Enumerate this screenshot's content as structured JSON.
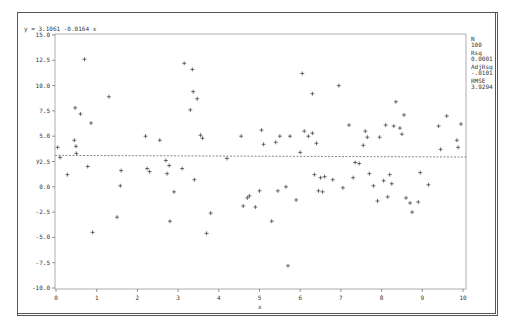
{
  "equation": "y = 3.1061 -0.0164 x",
  "stats": [
    {
      "label": "N",
      "value": "100"
    },
    {
      "label": "Rsq",
      "value": "0.0001"
    },
    {
      "label": "AdjRsq",
      "value": "-.0101"
    },
    {
      "label": "RMSE",
      "value": "3.9294"
    }
  ],
  "chart_data": {
    "type": "scatter",
    "title": "y = 3.1061 -0.0164 x",
    "xlabel": "x",
    "ylabel": "y",
    "xlim": [
      0,
      10
    ],
    "ylim": [
      -10,
      15
    ],
    "xticks": [
      "0",
      "1",
      "2",
      "3",
      "4",
      "5",
      "6",
      "7",
      "8",
      "9",
      "10"
    ],
    "yticks": [
      "15.0",
      "12.5",
      "10.0",
      "7.5",
      "5.0",
      "2.5",
      "0.0",
      "-2.5",
      "-5.0",
      "-7.5",
      "-10.0"
    ],
    "grid": false,
    "legend": "none",
    "regression": {
      "intercept": 3.1061,
      "slope": -0.0164,
      "style": "dashed"
    },
    "stats": {
      "N": 100,
      "Rsq": 0.0001,
      "AdjRsq": -0.0101,
      "RMSE": 3.9294
    },
    "points": [
      [
        0.04,
        3.9
      ],
      [
        0.1,
        2.9
      ],
      [
        0.28,
        1.2
      ],
      [
        0.45,
        4.6
      ],
      [
        0.47,
        7.8
      ],
      [
        0.49,
        4.0
      ],
      [
        0.5,
        3.3
      ],
      [
        0.6,
        7.2
      ],
      [
        0.7,
        12.6
      ],
      [
        0.78,
        2.0
      ],
      [
        0.86,
        6.3
      ],
      [
        0.9,
        -4.5
      ],
      [
        1.3,
        8.9
      ],
      [
        1.5,
        -3.0
      ],
      [
        1.6,
        1.6
      ],
      [
        1.58,
        0.1
      ],
      [
        2.2,
        5.0
      ],
      [
        2.24,
        1.8
      ],
      [
        2.3,
        1.5
      ],
      [
        2.55,
        4.6
      ],
      [
        2.7,
        2.6
      ],
      [
        2.73,
        1.3
      ],
      [
        2.78,
        2.1
      ],
      [
        2.8,
        -3.4
      ],
      [
        2.9,
        -0.5
      ],
      [
        3.1,
        1.8
      ],
      [
        3.15,
        12.2
      ],
      [
        3.3,
        7.6
      ],
      [
        3.35,
        11.6
      ],
      [
        3.37,
        9.4
      ],
      [
        3.4,
        0.7
      ],
      [
        3.47,
        8.7
      ],
      [
        3.55,
        5.1
      ],
      [
        3.6,
        4.8
      ],
      [
        3.7,
        -4.6
      ],
      [
        3.8,
        -2.6
      ],
      [
        4.2,
        2.8
      ],
      [
        4.55,
        5.0
      ],
      [
        4.6,
        -1.9
      ],
      [
        4.7,
        -1.1
      ],
      [
        4.75,
        -0.9
      ],
      [
        4.9,
        -2.0
      ],
      [
        5.0,
        -0.4
      ],
      [
        5.05,
        5.6
      ],
      [
        5.1,
        4.2
      ],
      [
        5.3,
        -3.4
      ],
      [
        5.4,
        4.4
      ],
      [
        5.45,
        -0.4
      ],
      [
        5.5,
        5.0
      ],
      [
        5.65,
        0.0
      ],
      [
        5.7,
        -7.8
      ],
      [
        5.75,
        5.0
      ],
      [
        5.9,
        -1.3
      ],
      [
        6.0,
        3.4
      ],
      [
        6.05,
        11.2
      ],
      [
        6.1,
        5.5
      ],
      [
        6.2,
        5.0
      ],
      [
        6.3,
        9.2
      ],
      [
        6.3,
        5.3
      ],
      [
        6.35,
        1.2
      ],
      [
        6.4,
        4.3
      ],
      [
        6.45,
        -0.4
      ],
      [
        6.5,
        0.9
      ],
      [
        6.55,
        -0.5
      ],
      [
        6.6,
        1.0
      ],
      [
        6.8,
        0.7
      ],
      [
        6.95,
        10.0
      ],
      [
        7.05,
        -0.1
      ],
      [
        7.2,
        6.1
      ],
      [
        7.3,
        0.9
      ],
      [
        7.35,
        2.4
      ],
      [
        7.45,
        2.3
      ],
      [
        7.55,
        4.1
      ],
      [
        7.6,
        5.5
      ],
      [
        7.65,
        4.9
      ],
      [
        7.7,
        1.3
      ],
      [
        7.8,
        0.1
      ],
      [
        7.9,
        -1.4
      ],
      [
        7.95,
        4.9
      ],
      [
        8.05,
        0.6
      ],
      [
        8.1,
        6.1
      ],
      [
        8.15,
        -1.0
      ],
      [
        8.2,
        1.2
      ],
      [
        8.25,
        0.3
      ],
      [
        8.3,
        6.0
      ],
      [
        8.35,
        8.4
      ],
      [
        8.45,
        5.8
      ],
      [
        8.5,
        5.2
      ],
      [
        8.55,
        7.1
      ],
      [
        8.6,
        -1.1
      ],
      [
        8.7,
        -1.6
      ],
      [
        8.75,
        -2.5
      ],
      [
        8.9,
        -1.5
      ],
      [
        8.95,
        1.4
      ],
      [
        9.15,
        0.2
      ],
      [
        9.4,
        6.0
      ],
      [
        9.45,
        3.7
      ],
      [
        9.6,
        7.0
      ],
      [
        9.85,
        4.6
      ],
      [
        9.88,
        3.9
      ],
      [
        9.95,
        6.2
      ]
    ]
  }
}
